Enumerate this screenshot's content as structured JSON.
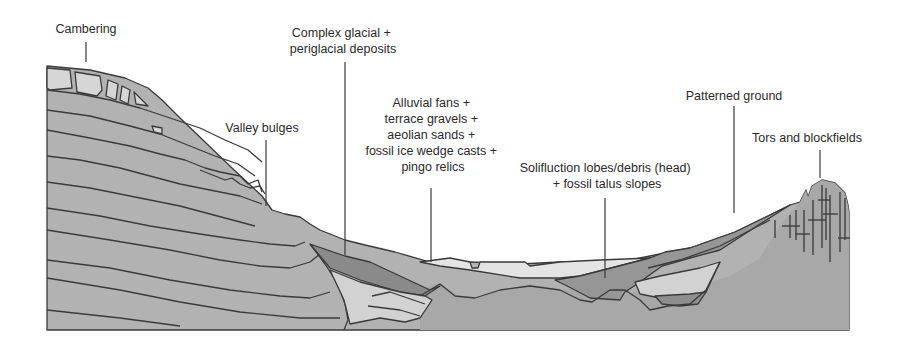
{
  "diagram": {
    "type": "geological cross-section",
    "labels": [
      {
        "id": "cambering",
        "lines": [
          "Cambering"
        ]
      },
      {
        "id": "complex-deposits",
        "lines": [
          "Complex glacial +",
          "periglacial deposits"
        ]
      },
      {
        "id": "valley-bulges",
        "lines": [
          "Valley bulges"
        ]
      },
      {
        "id": "alluvial",
        "lines": [
          "Alluvial fans +",
          "terrace gravels +",
          "aeolian sands +",
          "fossil ice wedge casts +",
          "pingo relics"
        ]
      },
      {
        "id": "solifluction",
        "lines": [
          "Solifluction lobes/debris (head)",
          "+ fossil talus slopes"
        ]
      },
      {
        "id": "patterned-ground",
        "lines": [
          "Patterned ground"
        ]
      },
      {
        "id": "tors",
        "lines": [
          "Tors and blockfields"
        ]
      }
    ],
    "colors": {
      "bedrock": "#a9a9a9",
      "strata": "#b4b4b4",
      "dark_deposit": "#8a8a8a",
      "light_deposit": "#d4d4d4",
      "very_light_deposit": "#e4e4e4",
      "line": "#3a3a3a",
      "background": "#ffffff"
    }
  }
}
